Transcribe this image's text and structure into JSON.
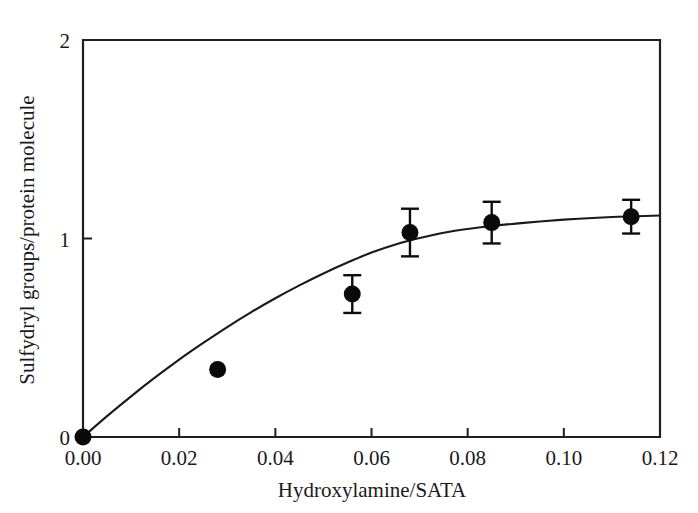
{
  "chart_data": {
    "type": "scatter",
    "title": "",
    "xlabel": "Hydroxylamine/SATA",
    "ylabel": "Sulfydryl groups/protein molecule",
    "xlim": [
      0.0,
      0.12
    ],
    "ylim": [
      0,
      2
    ],
    "xticks": [
      0.0,
      0.02,
      0.04,
      0.06,
      0.08,
      0.1,
      0.12
    ],
    "xticklabels": [
      "0.00",
      "0.02",
      "0.04",
      "0.06",
      "0.08",
      "0.10",
      "0.12"
    ],
    "yticks": [
      0,
      1,
      2
    ],
    "yticklabels": [
      "0",
      "1",
      "2"
    ],
    "grid": false,
    "legend": "none",
    "series": [
      {
        "name": "Sulfydryl groups per protein molecule",
        "marker": "filled-circle",
        "color": "#0a0a0a",
        "points": [
          {
            "x": 0.0,
            "y": 0.0,
            "yerr": 0.0
          },
          {
            "x": 0.028,
            "y": 0.34,
            "yerr": 0.0
          },
          {
            "x": 0.056,
            "y": 0.72,
            "yerr": 0.095
          },
          {
            "x": 0.068,
            "y": 1.03,
            "yerr": 0.12
          },
          {
            "x": 0.085,
            "y": 1.08,
            "yerr": 0.105
          },
          {
            "x": 0.114,
            "y": 1.11,
            "yerr": 0.085
          }
        ]
      }
    ],
    "fit_curve": {
      "name": "saturation fit",
      "color": "#1a1a1a",
      "points": [
        {
          "x": 0.0,
          "y": 0.0
        },
        {
          "x": 0.005,
          "y": 0.105
        },
        {
          "x": 0.01,
          "y": 0.205
        },
        {
          "x": 0.015,
          "y": 0.3
        },
        {
          "x": 0.02,
          "y": 0.39
        },
        {
          "x": 0.025,
          "y": 0.474
        },
        {
          "x": 0.03,
          "y": 0.554
        },
        {
          "x": 0.035,
          "y": 0.629
        },
        {
          "x": 0.04,
          "y": 0.699
        },
        {
          "x": 0.045,
          "y": 0.764
        },
        {
          "x": 0.05,
          "y": 0.824
        },
        {
          "x": 0.055,
          "y": 0.879
        },
        {
          "x": 0.06,
          "y": 0.929
        },
        {
          "x": 0.065,
          "y": 0.97
        },
        {
          "x": 0.07,
          "y": 1.002
        },
        {
          "x": 0.075,
          "y": 1.029
        },
        {
          "x": 0.08,
          "y": 1.048
        },
        {
          "x": 0.085,
          "y": 1.063
        },
        {
          "x": 0.09,
          "y": 1.075
        },
        {
          "x": 0.095,
          "y": 1.086
        },
        {
          "x": 0.1,
          "y": 1.095
        },
        {
          "x": 0.105,
          "y": 1.102
        },
        {
          "x": 0.11,
          "y": 1.108
        },
        {
          "x": 0.115,
          "y": 1.112
        },
        {
          "x": 0.12,
          "y": 1.116
        }
      ]
    }
  }
}
